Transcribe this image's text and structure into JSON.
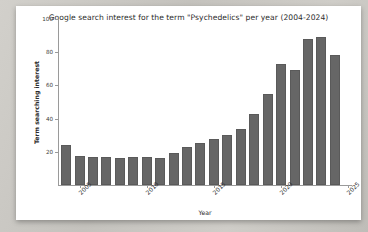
{
  "chart_data": {
    "type": "bar",
    "title": "Google search interest for the term \"Psychedelics\" per year (2004-2024)",
    "xlabel": "Year",
    "ylabel": "Term searching interest",
    "categories": [
      2004,
      2005,
      2006,
      2007,
      2008,
      2009,
      2010,
      2011,
      2012,
      2013,
      2014,
      2015,
      2016,
      2017,
      2018,
      2019,
      2020,
      2021,
      2022,
      2023,
      2024
    ],
    "values": [
      24,
      17.5,
      17,
      17,
      16.5,
      17,
      17,
      16.5,
      19.5,
      23,
      25.5,
      28,
      30,
      33.5,
      43,
      55,
      73,
      69.5,
      88,
      89,
      78.5
    ],
    "ylim": [
      0,
      100
    ],
    "yticks": [
      20,
      40,
      60,
      80,
      100
    ],
    "ytick_labels": [
      "20",
      "40",
      "60",
      "80",
      "100"
    ],
    "xticks": [
      2005,
      2010,
      2015,
      2020,
      2025
    ],
    "xtick_labels": [
      "2005",
      "2010",
      "2015",
      "2020",
      "2025"
    ],
    "xlim": [
      2003.4,
      2025.2
    ],
    "grid": false,
    "legend": null,
    "bar_color": "#666666",
    "background_color": "#ffffff"
  }
}
